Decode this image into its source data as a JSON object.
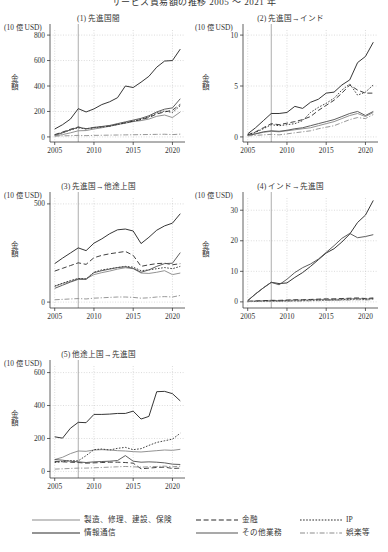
{
  "figure": {
    "title": "サービス貿易額の推移 2005 ～ 2021 年",
    "unit_label": "(10 億 USD)",
    "yaxis_label": "金額",
    "xticks": [
      "2005",
      "2010",
      "2015",
      "2020"
    ],
    "reference_line_year": 2008
  },
  "legend": {
    "items": [
      {
        "label": "製造、修理、建設、保険",
        "style": "solid",
        "color": "#8c8c8c"
      },
      {
        "label": "金融",
        "style": "dashed",
        "color": "#2b2b2b"
      },
      {
        "label": "IP",
        "style": "dotted",
        "color": "#2b2b2b"
      },
      {
        "label": "情報通信",
        "style": "solid",
        "color": "#2b2b2b"
      },
      {
        "label": "その他業務",
        "style": "solid",
        "color": "#555555"
      },
      {
        "label": "娯楽等",
        "style": "dashdot",
        "color": "#8c8c8c"
      }
    ]
  },
  "chart_data": [
    {
      "type": "line",
      "id": "panel1",
      "title": "(1) 先進国間",
      "xlabel": "",
      "ylabel": "金額",
      "unit": "(10 億 USD)",
      "x": [
        2005,
        2006,
        2007,
        2008,
        2009,
        2010,
        2011,
        2012,
        2013,
        2014,
        2015,
        2016,
        2017,
        2018,
        2019,
        2020,
        2021
      ],
      "xlim": [
        2004.4,
        2021.6
      ],
      "ylim": [
        -40,
        840
      ],
      "yticks": [
        0,
        200,
        400,
        600,
        800
      ],
      "xticks": [
        2005,
        2010,
        2015,
        2020
      ],
      "grid": true,
      "series": [
        {
          "name": "製造、修理、建設、保険",
          "style": "solid",
          "color": "#8c8c8c",
          "values": [
            8,
            18,
            32,
            48,
            50,
            62,
            72,
            84,
            96,
            108,
            120,
            128,
            140,
            162,
            172,
            152,
            196
          ]
        },
        {
          "name": "金融",
          "style": "dashed",
          "color": "#2b2b2b",
          "values": [
            18,
            38,
            60,
            78,
            64,
            74,
            80,
            86,
            100,
            112,
            124,
            136,
            152,
            180,
            196,
            210,
            256
          ]
        },
        {
          "name": "IP",
          "style": "dotted",
          "color": "#2b2b2b",
          "values": [
            16,
            34,
            54,
            72,
            62,
            72,
            78,
            84,
            98,
            110,
            124,
            138,
            158,
            188,
            204,
            192,
            246
          ]
        },
        {
          "name": "情報通信",
          "style": "solid",
          "color": "#2b2b2b",
          "values": [
            62,
            96,
            140,
            222,
            196,
            220,
            254,
            276,
            308,
            400,
            388,
            430,
            476,
            548,
            596,
            600,
            690
          ]
        },
        {
          "name": "その他業務",
          "style": "solid",
          "color": "#555555",
          "values": [
            14,
            32,
            56,
            76,
            64,
            74,
            82,
            90,
            104,
            118,
            132,
            146,
            166,
            196,
            218,
            228,
            300
          ]
        },
        {
          "name": "娯楽等",
          "style": "dashdot",
          "color": "#8c8c8c",
          "values": [
            6,
            8,
            10,
            12,
            10,
            12,
            13,
            14,
            15,
            16,
            17,
            18,
            19,
            20,
            21,
            18,
            22
          ]
        }
      ]
    },
    {
      "type": "line",
      "id": "panel2",
      "title": "(2) 先進国→インド",
      "xlabel": "",
      "ylabel": "金額",
      "unit": "(10 億 USD)",
      "x": [
        2005,
        2006,
        2007,
        2008,
        2009,
        2010,
        2011,
        2012,
        2013,
        2014,
        2015,
        2016,
        2017,
        2018,
        2019,
        2020,
        2021
      ],
      "xlim": [
        2004.4,
        2021.6
      ],
      "ylim": [
        -0.5,
        10.5
      ],
      "yticks": [
        0,
        5,
        10
      ],
      "xticks": [
        2005,
        2010,
        2015,
        2020
      ],
      "grid": true,
      "series": [
        {
          "name": "製造、修理、建設、保険",
          "style": "solid",
          "color": "#8c8c8c",
          "values": [
            0.15,
            0.3,
            0.45,
            0.55,
            0.5,
            0.6,
            0.7,
            0.8,
            0.9,
            1.1,
            1.3,
            1.5,
            1.8,
            2.1,
            2.3,
            2.0,
            2.4
          ]
        },
        {
          "name": "金融",
          "style": "dashed",
          "color": "#2b2b2b",
          "values": [
            0.2,
            0.5,
            0.9,
            1.3,
            1.2,
            1.35,
            1.5,
            1.7,
            2.0,
            2.6,
            3.1,
            3.6,
            4.3,
            5.1,
            4.6,
            4.3,
            4.3
          ]
        },
        {
          "name": "IP",
          "style": "dotted",
          "color": "#2b2b2b",
          "values": [
            0.2,
            0.45,
            0.8,
            1.2,
            1.1,
            1.2,
            1.3,
            1.6,
            2.4,
            2.9,
            3.3,
            3.8,
            4.6,
            5.2,
            4.1,
            4.4,
            5.1
          ]
        },
        {
          "name": "情報通信",
          "style": "solid",
          "color": "#2b2b2b",
          "values": [
            0.3,
            0.9,
            1.6,
            2.3,
            2.3,
            2.4,
            3.0,
            2.8,
            3.4,
            3.7,
            4.3,
            4.4,
            5.1,
            5.6,
            7.3,
            7.9,
            9.3
          ]
        },
        {
          "name": "その他業務",
          "style": "solid",
          "color": "#555555",
          "values": [
            0.15,
            0.3,
            0.5,
            0.6,
            0.55,
            0.65,
            0.8,
            0.9,
            1.1,
            1.3,
            1.5,
            1.7,
            2.0,
            2.3,
            2.5,
            2.1,
            2.5
          ]
        },
        {
          "name": "娯楽等",
          "style": "dashdot",
          "color": "#8c8c8c",
          "values": [
            0.1,
            0.15,
            0.2,
            0.25,
            0.2,
            0.3,
            0.4,
            0.5,
            0.6,
            0.8,
            0.95,
            1.1,
            1.4,
            1.7,
            1.9,
            1.8,
            2.2
          ]
        }
      ]
    },
    {
      "type": "line",
      "id": "panel3",
      "title": "(3) 先進国→他途上国",
      "xlabel": "",
      "ylabel": "金額",
      "unit": "(10 億 USD)",
      "x": [
        2005,
        2006,
        2007,
        2008,
        2009,
        2010,
        2011,
        2012,
        2013,
        2014,
        2015,
        2016,
        2017,
        2018,
        2019,
        2020,
        2021
      ],
      "xlim": [
        2004.4,
        2021.6
      ],
      "ylim": [
        -30,
        530
      ],
      "yticks": [
        0,
        500
      ],
      "xticks": [
        2005,
        2010,
        2015,
        2020
      ],
      "grid": true,
      "series": [
        {
          "name": "製造、修理、建設、保険",
          "style": "solid",
          "color": "#8c8c8c",
          "values": [
            80,
            95,
            105,
            120,
            118,
            140,
            150,
            158,
            168,
            175,
            170,
            148,
            146,
            152,
            160,
            140,
            148
          ]
        },
        {
          "name": "金融",
          "style": "dashed",
          "color": "#2b2b2b",
          "values": [
            158,
            172,
            186,
            200,
            192,
            226,
            238,
            246,
            252,
            258,
            238,
            182,
            190,
            196,
            198,
            190,
            196
          ]
        },
        {
          "name": "IP",
          "style": "dotted",
          "color": "#2b2b2b",
          "values": [
            82,
            96,
            110,
            120,
            118,
            152,
            164,
            170,
            176,
            182,
            178,
            160,
            164,
            170,
            176,
            170,
            182
          ]
        },
        {
          "name": "情報通信",
          "style": "solid",
          "color": "#2b2b2b",
          "values": [
            196,
            224,
            250,
            276,
            262,
            300,
            322,
            348,
            368,
            372,
            362,
            298,
            330,
            366,
            388,
            402,
            450
          ]
        },
        {
          "name": "その他業務",
          "style": "solid",
          "color": "#555555",
          "values": [
            70,
            86,
            102,
            116,
            116,
            150,
            160,
            168,
            176,
            180,
            172,
            152,
            164,
            182,
            196,
            198,
            252
          ]
        },
        {
          "name": "娯楽等",
          "style": "dashdot",
          "color": "#8c8c8c",
          "values": [
            12,
            14,
            16,
            18,
            16,
            20,
            22,
            24,
            26,
            26,
            24,
            20,
            22,
            26,
            28,
            26,
            34
          ]
        }
      ]
    },
    {
      "type": "line",
      "id": "panel4",
      "title": "(4) インド→先進国",
      "xlabel": "",
      "ylabel": "金額",
      "unit": "(10 億 USD)",
      "x": [
        2005,
        2006,
        2007,
        2008,
        2009,
        2010,
        2011,
        2012,
        2013,
        2014,
        2015,
        2016,
        2017,
        2018,
        2019,
        2020,
        2021
      ],
      "xlim": [
        2004.4,
        2021.6
      ],
      "ylim": [
        -2,
        34
      ],
      "yticks": [
        0,
        10,
        20,
        30
      ],
      "xticks": [
        2005,
        2010,
        2015,
        2020
      ],
      "grid": true,
      "series": [
        {
          "name": "製造、修理、建設、保険",
          "style": "solid",
          "color": "#8c8c8c",
          "values": [
            0.2,
            0.3,
            0.4,
            0.5,
            0.4,
            0.5,
            0.6,
            0.6,
            0.7,
            0.8,
            0.8,
            0.8,
            0.9,
            1.0,
            1.1,
            0.9,
            1.1
          ]
        },
        {
          "name": "金融",
          "style": "dashed",
          "color": "#2b2b2b",
          "values": [
            0.2,
            0.3,
            0.4,
            0.5,
            0.5,
            0.6,
            0.7,
            0.7,
            0.8,
            0.9,
            1.0,
            1.0,
            1.1,
            1.2,
            1.3,
            1.1,
            1.3
          ]
        },
        {
          "name": "IP",
          "style": "dotted",
          "color": "#2b2b2b",
          "values": [
            0.1,
            0.15,
            0.2,
            0.25,
            0.25,
            0.3,
            0.35,
            0.4,
            0.45,
            0.5,
            0.55,
            0.6,
            0.7,
            0.8,
            0.9,
            0.8,
            1.0
          ]
        },
        {
          "name": "情報通信",
          "style": "solid",
          "color": "#2b2b2b",
          "values": [
            0.4,
            2.6,
            4.6,
            6.4,
            6.0,
            6.2,
            8.0,
            9.6,
            11.6,
            13.8,
            16.0,
            17.4,
            19.6,
            22.2,
            26.0,
            28.4,
            33.2
          ]
        },
        {
          "name": "その他業務",
          "style": "solid",
          "color": "#555555",
          "values": [
            0.4,
            2.6,
            4.6,
            6.4,
            5.6,
            7.4,
            9.6,
            11.2,
            12.4,
            14.0,
            16.2,
            18.4,
            20.8,
            22.4,
            21.0,
            21.4,
            22.0
          ]
        },
        {
          "name": "娯楽等",
          "style": "dashdot",
          "color": "#8c8c8c",
          "values": [
            0.1,
            0.12,
            0.15,
            0.2,
            0.2,
            0.22,
            0.25,
            0.3,
            0.35,
            0.4,
            0.45,
            0.5,
            0.55,
            0.6,
            0.7,
            0.6,
            0.8
          ]
        }
      ]
    },
    {
      "type": "line",
      "id": "panel5",
      "title": "(5) 他途上国→先進国",
      "xlabel": "",
      "ylabel": "金額",
      "unit": "(10 億 USD)",
      "x": [
        2005,
        2006,
        2007,
        2008,
        2009,
        2010,
        2011,
        2012,
        2013,
        2014,
        2015,
        2016,
        2017,
        2018,
        2019,
        2020,
        2021
      ],
      "xlim": [
        2004.4,
        2021.6
      ],
      "ylim": [
        -40,
        640
      ],
      "yticks": [
        0,
        200,
        400,
        600
      ],
      "xticks": [
        2005,
        2010,
        2015,
        2020
      ],
      "grid": true,
      "series": [
        {
          "name": "製造、修理、建設、保険",
          "style": "solid",
          "color": "#8c8c8c",
          "values": [
            72,
            86,
            108,
            124,
            122,
            130,
            132,
            130,
            126,
            124,
            120,
            118,
            122,
            126,
            130,
            128,
            134
          ]
        },
        {
          "name": "金融",
          "style": "dashed",
          "color": "#2b2b2b",
          "values": [
            60,
            58,
            56,
            54,
            50,
            52,
            54,
            56,
            56,
            54,
            50,
            16,
            20,
            24,
            26,
            18,
            20
          ]
        },
        {
          "name": "IP",
          "style": "dotted",
          "color": "#2b2b2b",
          "values": [
            54,
            60,
            66,
            64,
            96,
            132,
            136,
            130,
            140,
            146,
            132,
            138,
            158,
            176,
            186,
            196,
            232
          ]
        },
        {
          "name": "情報通信",
          "style": "solid",
          "color": "#2b2b2b",
          "values": [
            210,
            202,
            262,
            298,
            296,
            346,
            346,
            348,
            352,
            352,
            366,
            318,
            334,
            484,
            486,
            472,
            428
          ]
        },
        {
          "name": "その他業務",
          "style": "solid",
          "color": "#555555",
          "values": [
            72,
            68,
            62,
            58,
            54,
            58,
            60,
            62,
            66,
            96,
            62,
            56,
            58,
            56,
            52,
            44,
            42
          ]
        },
        {
          "name": "娯楽等",
          "style": "dashdot",
          "color": "#8c8c8c",
          "values": [
            14,
            16,
            18,
            20,
            20,
            22,
            24,
            26,
            28,
            30,
            28,
            26,
            28,
            30,
            32,
            28,
            32
          ]
        }
      ]
    }
  ]
}
